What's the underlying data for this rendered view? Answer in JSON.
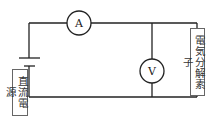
{
  "diagram": {
    "type": "circuit",
    "ammeter": {
      "symbol": "A"
    },
    "voltmeter": {
      "symbol": "V"
    },
    "power_supply_label": "直流電源",
    "element_label": "電気分解素子"
  }
}
